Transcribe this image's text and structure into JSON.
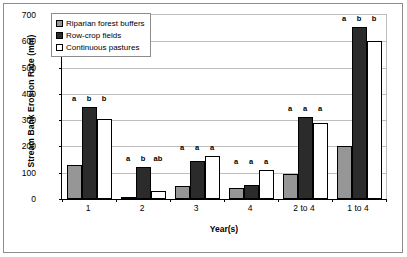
{
  "chart_data": {
    "type": "bar",
    "title": "",
    "xlabel": "Year(s)",
    "ylabel": "Stream Bank Erosion Rate (mm)",
    "ylim": [
      0,
      700
    ],
    "yticks": [
      0,
      100,
      200,
      300,
      400,
      500,
      600,
      700
    ],
    "grid": true,
    "legend_position": "top-left inside plot",
    "categories": [
      "1",
      "2",
      "3",
      "4",
      "2 to 4",
      "1 to 4"
    ],
    "series": [
      {
        "name": "Riparian forest buffers",
        "color": "#969696",
        "values": [
          130,
          8,
          48,
          42,
          95,
          200
        ],
        "annotations": [
          "a",
          "a",
          "a",
          "a",
          "a",
          "a"
        ]
      },
      {
        "name": "Row-crop fields",
        "color": "#2b2b2b",
        "values": [
          350,
          120,
          145,
          52,
          312,
          655
        ],
        "annotations": [
          "b",
          "b",
          "a",
          "a",
          "a",
          "b"
        ]
      },
      {
        "name": "Continuous pastures",
        "color": "#ffffff",
        "values": [
          305,
          32,
          165,
          110,
          288,
          600
        ],
        "annotations": [
          "b",
          "ab",
          "a",
          "a",
          "a",
          "b"
        ]
      }
    ]
  }
}
